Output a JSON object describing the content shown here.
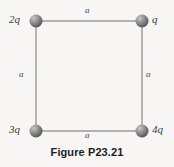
{
  "figure": {
    "caption": "Figure P23.21",
    "shape": "square",
    "geometry": {
      "corners": [
        {
          "id": "top-left",
          "cx": 36,
          "cy": 21
        },
        {
          "id": "top-right",
          "cx": 142,
          "cy": 21
        },
        {
          "id": "bottom-left",
          "cx": 36,
          "cy": 131
        },
        {
          "id": "bottom-right",
          "cx": 142,
          "cy": 131
        }
      ],
      "sphere_radius": 6.5
    },
    "charges": [
      {
        "position": "top-left",
        "label": "2q"
      },
      {
        "position": "top-right",
        "label": "q"
      },
      {
        "position": "bottom-left",
        "label": "3q"
      },
      {
        "position": "bottom-right",
        "label": "4q"
      }
    ],
    "sides": [
      {
        "position": "top",
        "label": "a"
      },
      {
        "position": "left",
        "label": "a"
      },
      {
        "position": "right",
        "label": "a"
      },
      {
        "position": "bottom",
        "label": "a"
      }
    ],
    "colors": {
      "background": "#f7f6f4",
      "edge_line": "#9a9a9a",
      "sphere_dark": "#5c5c5c",
      "sphere_mid": "#8e8e8e",
      "sphere_light": "#c8c8c8",
      "text": "#3b3b3b",
      "caption_text": "#1c1c1c"
    }
  }
}
